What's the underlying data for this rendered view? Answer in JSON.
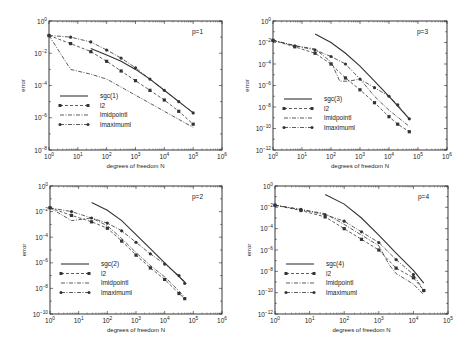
{
  "chart_data": [
    {
      "type": "line",
      "panel": "p=1",
      "title": "p=1",
      "xlabel": "degrees of freedom N",
      "ylabel": "error",
      "xscale": "log",
      "yscale": "log",
      "xlim_exp": [
        0,
        6
      ],
      "ylim_exp": [
        -8,
        0
      ],
      "xticks": [
        "10^0",
        "10^1",
        "10^2",
        "10^3",
        "10^4",
        "10^5",
        "10^6"
      ],
      "yticks": [
        "10^0",
        "10^-2",
        "10^-4",
        "10^-6",
        "10^-8"
      ],
      "grid": false,
      "legend_position": "lower left",
      "series": [
        {
          "name": "sgc(1)",
          "style": "solid",
          "marker": "none",
          "x_exp": [
            1.45,
            2.0,
            2.5,
            3.0,
            3.5,
            4.0,
            4.5,
            5.0
          ],
          "y_exp": [
            -1.7,
            -2.1,
            -2.5,
            -3.0,
            -3.6,
            -4.3,
            -5.0,
            -5.7
          ]
        },
        {
          "name": "l2",
          "style": "dashed",
          "marker": "square",
          "x_exp": [
            0.0,
            0.75,
            1.45,
            2.0,
            2.5,
            3.0,
            3.5,
            4.0,
            4.5,
            5.0
          ],
          "y_exp": [
            -0.9,
            -1.4,
            -1.9,
            -2.5,
            -3.1,
            -3.7,
            -4.3,
            -4.9,
            -5.6,
            -6.4
          ]
        },
        {
          "name": "lmidpointl",
          "style": "dashdot",
          "marker": "none",
          "x_exp": [
            0.0,
            0.75,
            1.45,
            2.0,
            2.5,
            3.0,
            3.5,
            4.0,
            4.5,
            5.0
          ],
          "y_exp": [
            -0.9,
            -3.0,
            -3.3,
            -3.6,
            -4.1,
            -4.6,
            -5.1,
            -5.6,
            -6.1,
            -6.6
          ]
        },
        {
          "name": "lmaximuml",
          "style": "dashdot",
          "marker": "circle",
          "x_exp": [
            0.0,
            0.75,
            1.45,
            2.0,
            2.5,
            3.0,
            3.5,
            4.0,
            4.5,
            5.0
          ],
          "y_exp": [
            -0.9,
            -1.0,
            -1.3,
            -1.8,
            -2.3,
            -2.9,
            -3.6,
            -4.3,
            -5.0,
            -5.7
          ]
        }
      ]
    },
    {
      "type": "line",
      "panel": "p=3",
      "title": "p=3",
      "xlabel": "degrees of freedom N",
      "ylabel": "error",
      "xscale": "log",
      "yscale": "log",
      "xlim_exp": [
        0,
        6
      ],
      "ylim_exp": [
        -12,
        0
      ],
      "xticks": [
        "10^0",
        "10^1",
        "10^2",
        "10^3",
        "10^4",
        "10^5",
        "10^6"
      ],
      "yticks": [
        "10^0",
        "10^-2",
        "10^-4",
        "10^-6",
        "10^-8",
        "10^-10",
        "10^-12"
      ],
      "grid": false,
      "legend_position": "lower left",
      "series": [
        {
          "name": "sgc(3)",
          "style": "solid",
          "marker": "none",
          "x_exp": [
            1.45,
            2.0,
            2.5,
            3.0,
            3.5,
            4.0,
            4.7
          ],
          "y_exp": [
            -1.2,
            -2.0,
            -3.0,
            -4.2,
            -5.6,
            -7.0,
            -9.1
          ]
        },
        {
          "name": "l2",
          "style": "dashed",
          "marker": "square",
          "x_exp": [
            0.0,
            0.75,
            1.45,
            2.0,
            2.5,
            3.0,
            3.5,
            4.0,
            4.3,
            4.7
          ],
          "y_exp": [
            -1.8,
            -2.4,
            -3.0,
            -4.0,
            -5.3,
            -6.4,
            -7.6,
            -8.9,
            -9.6,
            -10.3
          ]
        },
        {
          "name": "lmidpointl",
          "style": "dashdot",
          "marker": "none",
          "x_exp": [
            0.0,
            0.75,
            1.45,
            2.0,
            2.3,
            2.6,
            3.0,
            3.5,
            4.0,
            4.7
          ],
          "y_exp": [
            -1.8,
            -2.3,
            -2.6,
            -3.8,
            -5.6,
            -5.6,
            -5.4,
            -7.0,
            -8.3,
            -9.8
          ]
        },
        {
          "name": "lmaximuml",
          "style": "dashdot",
          "marker": "circle",
          "x_exp": [
            0.0,
            0.75,
            1.45,
            2.0,
            2.5,
            3.0,
            3.5,
            4.0,
            4.3,
            4.7
          ],
          "y_exp": [
            -1.8,
            -2.3,
            -2.7,
            -3.3,
            -4.0,
            -5.4,
            -6.2,
            -7.0,
            -7.8,
            -9.1
          ]
        }
      ]
    },
    {
      "type": "line",
      "panel": "p=2",
      "title": "p=2",
      "xlabel": "degrees of freedom N",
      "ylabel": "error",
      "xscale": "log",
      "yscale": "log",
      "xlim_exp": [
        0,
        6
      ],
      "ylim_exp": [
        -10,
        0
      ],
      "xticks": [
        "10^0",
        "10^1",
        "10^2",
        "10^3",
        "10^4",
        "10^5",
        "10^6"
      ],
      "yticks": [
        "10^0",
        "10^-2",
        "10^-4",
        "10^-6",
        "10^-8",
        "10^-10"
      ],
      "grid": false,
      "legend_position": "lower left",
      "series": [
        {
          "name": "sgc(2)",
          "style": "solid",
          "marker": "none",
          "x_exp": [
            1.45,
            2.0,
            2.5,
            3.0,
            3.5,
            4.0,
            4.7
          ],
          "y_exp": [
            -1.3,
            -1.9,
            -2.7,
            -3.8,
            -4.9,
            -6.0,
            -7.5
          ]
        },
        {
          "name": "l2",
          "style": "dashed",
          "marker": "square",
          "x_exp": [
            0.0,
            0.75,
            1.45,
            2.0,
            2.5,
            3.0,
            3.5,
            4.0,
            4.5,
            4.7
          ],
          "y_exp": [
            -1.7,
            -2.3,
            -2.8,
            -3.3,
            -4.3,
            -5.4,
            -6.4,
            -7.3,
            -8.4,
            -8.8
          ]
        },
        {
          "name": "lmidpointl",
          "style": "dashdot",
          "marker": "none",
          "x_exp": [
            0.0,
            0.75,
            1.45,
            2.0,
            2.5,
            3.0,
            3.5,
            4.0,
            4.5,
            4.7
          ],
          "y_exp": [
            -1.7,
            -2.7,
            -2.5,
            -3.1,
            -4.1,
            -5.2,
            -6.2,
            -7.1,
            -8.2,
            -8.7
          ]
        },
        {
          "name": "lmaximuml",
          "style": "dashdot",
          "marker": "circle",
          "x_exp": [
            0.0,
            0.75,
            1.45,
            2.0,
            2.5,
            3.0,
            3.5,
            4.0,
            4.5,
            4.7
          ],
          "y_exp": [
            -1.7,
            -2.0,
            -2.5,
            -2.9,
            -3.5,
            -4.4,
            -5.3,
            -6.1,
            -7.0,
            -7.6
          ]
        }
      ]
    },
    {
      "type": "line",
      "panel": "p=4",
      "title": "p=4",
      "xlabel": "degrees of freedom N",
      "ylabel": "error",
      "xscale": "log",
      "yscale": "log",
      "xlim_exp": [
        0,
        5
      ],
      "ylim_exp": [
        -12,
        0
      ],
      "xticks": [
        "10^0",
        "10^1",
        "10^2",
        "10^3",
        "10^4",
        "10^5"
      ],
      "yticks": [
        "10^0",
        "10^-2",
        "10^-4",
        "10^-6",
        "10^-8",
        "10^-10",
        "10^-12"
      ],
      "grid": false,
      "legend_position": "lower left",
      "series": [
        {
          "name": "sgc(4)",
          "style": "solid",
          "marker": "none",
          "x_exp": [
            1.45,
            2.0,
            2.5,
            3.0,
            3.5,
            4.0,
            4.3
          ],
          "y_exp": [
            -0.8,
            -1.7,
            -3.0,
            -4.6,
            -6.3,
            -7.9,
            -9.1
          ]
        },
        {
          "name": "l2",
          "style": "dashed",
          "marker": "square",
          "x_exp": [
            0.0,
            0.75,
            1.45,
            2.0,
            2.5,
            3.0,
            3.5,
            4.0,
            4.3
          ],
          "y_exp": [
            -1.8,
            -2.3,
            -2.9,
            -4.0,
            -5.0,
            -6.0,
            -7.7,
            -8.6,
            -9.8
          ]
        },
        {
          "name": "lmidpointl",
          "style": "dashdot",
          "marker": "none",
          "x_exp": [
            0.0,
            0.75,
            1.45,
            2.0,
            2.5,
            3.0,
            3.3,
            3.5,
            4.0,
            4.3
          ],
          "y_exp": [
            -1.8,
            -2.2,
            -2.6,
            -3.6,
            -4.6,
            -5.6,
            -7.4,
            -8.2,
            -9.2,
            -10.2
          ]
        },
        {
          "name": "lmaximuml",
          "style": "dashdot",
          "marker": "circle",
          "x_exp": [
            0.0,
            0.75,
            1.45,
            2.0,
            2.5,
            3.0,
            3.5,
            4.0,
            4.3
          ],
          "y_exp": [
            -1.8,
            -2.2,
            -2.7,
            -3.3,
            -4.3,
            -5.3,
            -6.9,
            -8.3,
            -9.8
          ]
        }
      ]
    }
  ],
  "panels_layout": [
    {
      "panel_index": 0,
      "left": 49,
      "top": 21,
      "right": 222,
      "bottom": 150
    },
    {
      "panel_index": 1,
      "left": 273,
      "top": 21,
      "right": 447,
      "bottom": 150
    },
    {
      "panel_index": 2,
      "left": 50,
      "top": 186,
      "right": 222,
      "bottom": 314
    },
    {
      "panel_index": 3,
      "left": 275,
      "top": 186,
      "right": 448,
      "bottom": 314
    }
  ],
  "colors": {
    "line": "#333333",
    "axis": "#222222",
    "background": "#ffffff"
  }
}
